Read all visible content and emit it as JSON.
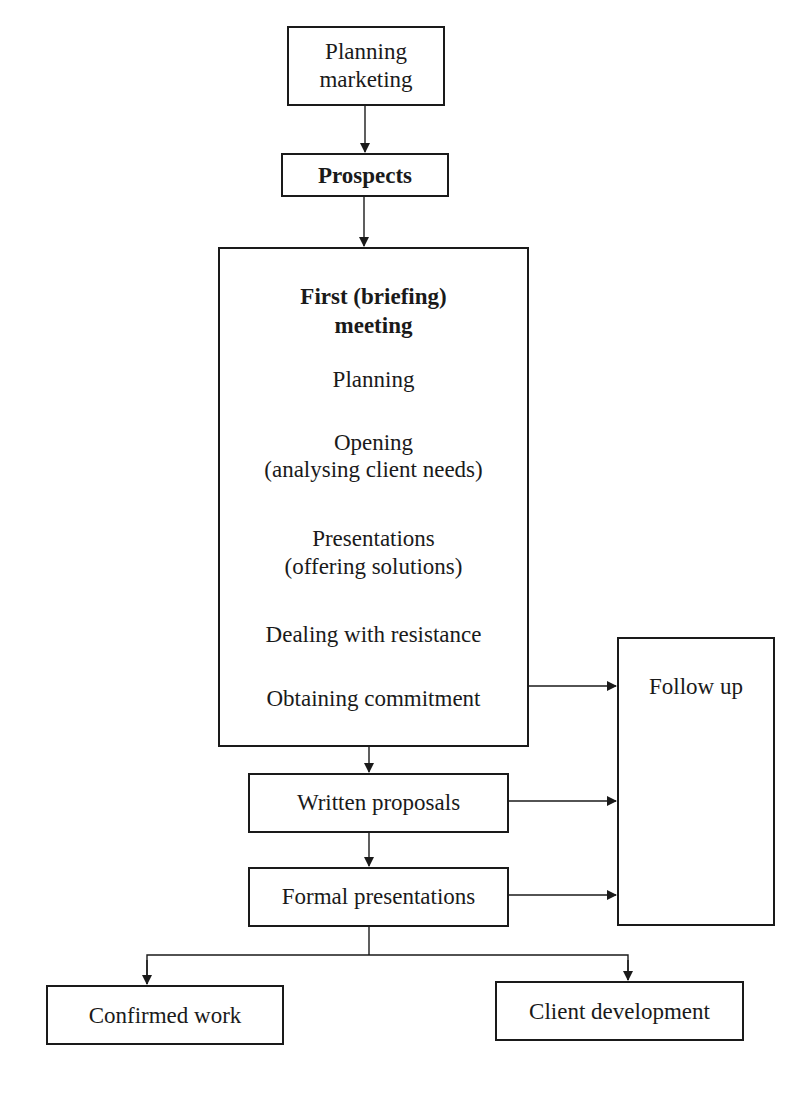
{
  "diagram": {
    "nodes": {
      "planning_marketing": {
        "line1": "Planning",
        "line2": "marketing"
      },
      "prospects": {
        "label": "Prospects"
      },
      "first_meeting": {
        "title_line1": "First (briefing)",
        "title_line2": "meeting",
        "steps": [
          {
            "line1": "Planning"
          },
          {
            "line1": "Opening",
            "line2": "(analysing client needs)"
          },
          {
            "line1": "Presentations",
            "line2": "(offering solutions)"
          },
          {
            "line1": "Dealing with resistance"
          },
          {
            "line1": "Obtaining commitment"
          }
        ]
      },
      "follow_up": {
        "label": "Follow up"
      },
      "written_proposals": {
        "label": "Written proposals"
      },
      "formal_presentations": {
        "label": "Formal presentations"
      },
      "confirmed_work": {
        "label": "Confirmed work"
      },
      "client_development": {
        "label": "Client development"
      }
    },
    "edges": [
      {
        "from": "Planning marketing",
        "to": "Prospects"
      },
      {
        "from": "Prospects",
        "to": "First (briefing) meeting"
      },
      {
        "from": "First (briefing) meeting",
        "to": "Written proposals"
      },
      {
        "from": "Obtaining commitment",
        "to": "Follow up"
      },
      {
        "from": "Written proposals",
        "to": "Follow up"
      },
      {
        "from": "Written proposals",
        "to": "Formal presentations"
      },
      {
        "from": "Formal presentations",
        "to": "Follow up"
      },
      {
        "from": "Formal presentations",
        "to": "Confirmed work"
      },
      {
        "from": "Formal presentations",
        "to": "Client development"
      }
    ]
  }
}
